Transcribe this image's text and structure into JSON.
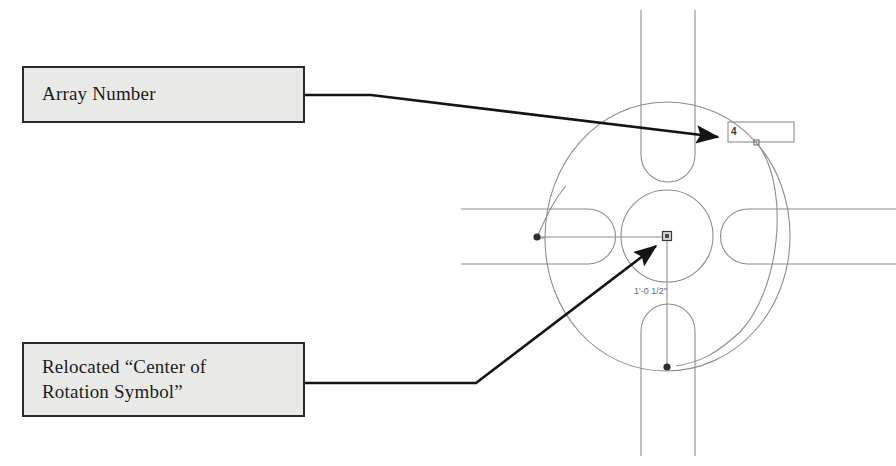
{
  "figure": {
    "background_color": "#ffffff"
  },
  "callouts": [
    {
      "id": "array-number",
      "label": "Array Number",
      "fill_color": "#e9e9e7",
      "border_color": "#2b2b2b"
    },
    {
      "id": "rotation-symbol",
      "label": "Relocated “Center of\nRotation Symbol”",
      "fill_color": "#e9e9e7",
      "border_color": "#2b2b2b"
    }
  ],
  "drawing": {
    "array_count_label": "4",
    "dimension_label": "1'-0 1/2\"",
    "line_color": "#8a8a8a",
    "leader_color": "#1a1a1a",
    "grip_color": "#333333",
    "icons": {
      "center_of_rotation": "rotation-grip-square-icon",
      "array_grip": "grip-dot-icon",
      "leader_arrow": "arrow-head-icon"
    }
  }
}
